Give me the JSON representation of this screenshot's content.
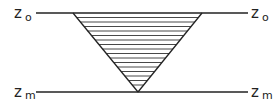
{
  "diagram": {
    "type": "hatched inverted triangle between two horizontal levels",
    "colors": {
      "line": "#222222",
      "hatch": "#333333",
      "background": "#ffffff"
    },
    "levels": {
      "top": {
        "symbol": "z",
        "subscript": "o",
        "y": 13
      },
      "bottom": {
        "symbol": "z",
        "subscript": "m",
        "y": 92
      }
    },
    "lines": {
      "x_start": 36,
      "x_end": 248
    },
    "triangle": {
      "top_left": [
        73,
        13
      ],
      "top_right": [
        202,
        13
      ],
      "apex": [
        138,
        92
      ],
      "hatch_count": 17,
      "hatch_spacing": 4.5
    }
  }
}
